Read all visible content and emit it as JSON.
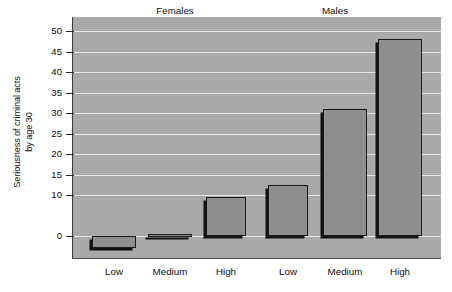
{
  "chart_data": {
    "type": "bar",
    "title": "",
    "xlabel": "",
    "ylabel": "Seriousness of criminal acts by age 30",
    "ylabel_lines": [
      "Seriousness of criminal acts",
      "by age 30"
    ],
    "ylim": [
      -5,
      52
    ],
    "grid": true,
    "grid_orientation": "horizontal",
    "legend": "none",
    "legend_position": "none",
    "ytick_labels": [
      "50",
      "45",
      "40",
      "35",
      "30",
      "25",
      "20",
      "15",
      "10",
      "0"
    ],
    "ytick_values": [
      50,
      45,
      40,
      35,
      30,
      25,
      20,
      15,
      10,
      0
    ],
    "categories": [
      "Low",
      "Medium",
      "High",
      "Low",
      "Medium",
      "High"
    ],
    "values": [
      -3,
      0.5,
      9.5,
      12.5,
      31,
      48
    ],
    "group_labels": [
      "Females",
      "Males"
    ],
    "groups": [
      {
        "name": "Females",
        "categories": [
          "Low",
          "Medium",
          "High"
        ],
        "values": [
          -3,
          0.5,
          9.5
        ]
      },
      {
        "name": "Males",
        "categories": [
          "Low",
          "Medium",
          "High"
        ],
        "values": [
          12.5,
          31,
          48
        ]
      }
    ],
    "bars": [
      {
        "label": "Low",
        "group": "Females",
        "value": -3
      },
      {
        "label": "Medium",
        "group": "Females",
        "value": 0.5
      },
      {
        "label": "High",
        "group": "Females",
        "value": 9.5
      },
      {
        "label": "Low",
        "group": "Males",
        "value": 12.5
      },
      {
        "label": "Medium",
        "group": "Males",
        "value": 31
      },
      {
        "label": "High",
        "group": "Males",
        "value": 48
      }
    ],
    "colors": {
      "plot_background": "#a9a9a9",
      "bar_fill": "#8e8e8e",
      "bar_outline": "#1a1a1a",
      "bar_shadow": "#111111",
      "gridline": "#e8e8e8",
      "axis": "#3a3a3a",
      "text": "#101010",
      "page_background": "#ffffff"
    }
  }
}
